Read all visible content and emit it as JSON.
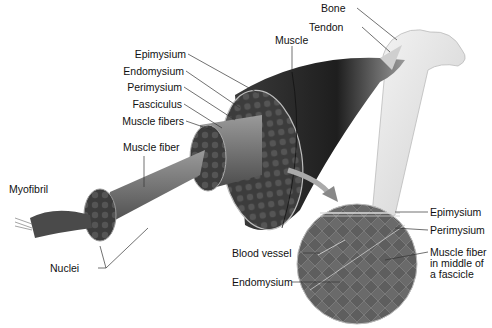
{
  "diagram": {
    "labels_left": {
      "epimysium": "Epimysium",
      "endomysium": "Endomysium",
      "perimysium": "Perimysium",
      "fasciculus": "Fasciculus",
      "muscle_fibers": "Muscle fibers",
      "muscle_fiber": "Muscle fiber",
      "myofibril": "Myofibril",
      "nuclei": "Nuclei"
    },
    "labels_top": {
      "muscle": "Muscle",
      "bone": "Bone",
      "tendon": "Tendon"
    },
    "micrograph_labels": {
      "epimysium": "Epimysium",
      "perimysium": "Perimysium",
      "muscle_fiber_fascicle": "Muscle fiber in middle of a fascicle",
      "blood_vessel": "Blood vessel",
      "endomysium": "Endomysium"
    },
    "colors": {
      "muscle_dark": "#2a2a2a",
      "muscle_mid": "#5a5a5a",
      "bone": "#e6e6e6",
      "micrograph": "#6e6e6e",
      "leader_line": "#333333"
    }
  }
}
